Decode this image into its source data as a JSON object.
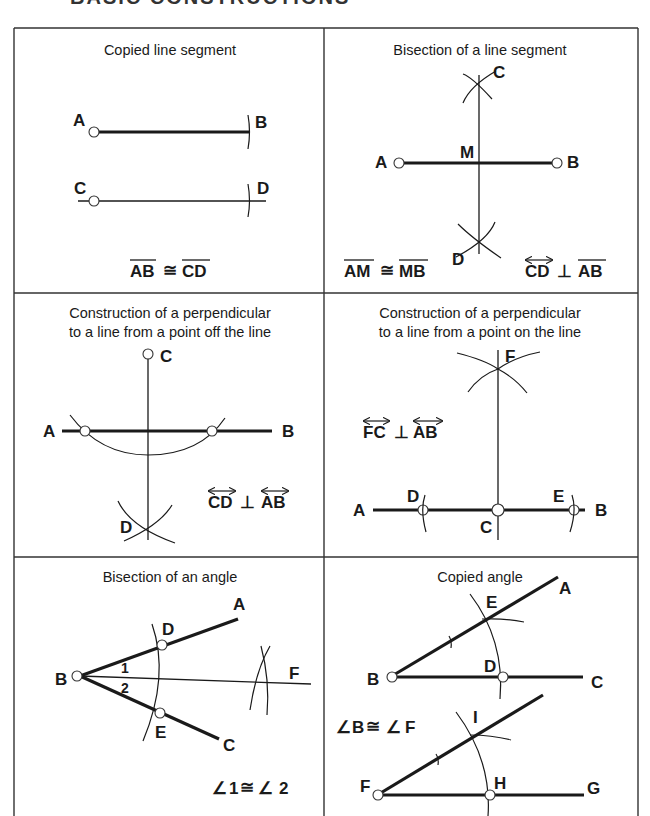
{
  "page": {
    "cropped_heading": "BASIC CONSTRUCTIONS"
  },
  "panels": [
    {
      "title": "Copied line segment",
      "points": {
        "A": "A",
        "B": "B",
        "C": "C",
        "D": "D"
      },
      "relation": {
        "left": "AB",
        "symbol": "≅",
        "right": "CD"
      }
    },
    {
      "title": "Bisection of a line segment",
      "points": {
        "A": "A",
        "B": "B",
        "C": "C",
        "D": "D",
        "M": "M"
      },
      "relation1": {
        "left": "AM",
        "symbol": "≅",
        "right": "MB"
      },
      "relation2": {
        "left": "CD",
        "symbol": "⊥",
        "right": "AB"
      }
    },
    {
      "title_line1": "Construction of a perpendicular",
      "title_line2": "to a line from a point off the line",
      "points": {
        "A": "A",
        "B": "B",
        "C": "C",
        "D": "D"
      },
      "relation": {
        "left": "CD",
        "symbol": "⊥",
        "right": "AB"
      }
    },
    {
      "title_line1": "Construction of a perpendicular",
      "title_line2": "to a line from a point on the line",
      "points": {
        "A": "A",
        "B": "B",
        "C": "C",
        "D": "D",
        "E": "E",
        "F": "F"
      },
      "relation": {
        "left": "FC",
        "symbol": "⊥",
        "right": "AB"
      }
    },
    {
      "title": "Bisection of an angle",
      "points": {
        "A": "A",
        "B": "B",
        "C": "C",
        "D": "D",
        "E": "E",
        "F": "F"
      },
      "angle_labels": {
        "one": "1",
        "two": "2"
      },
      "relation": {
        "angle": "∠",
        "left": "1",
        "symbol": "≅",
        "right": "2"
      }
    },
    {
      "title": "Copied angle",
      "points": {
        "A": "A",
        "B": "B",
        "C": "C",
        "D": "D",
        "E": "E",
        "F": "F",
        "G": "G",
        "H": "H",
        "I": "I"
      },
      "relation": {
        "angle": "∠",
        "left": "B",
        "symbol": "≅",
        "right": "F"
      }
    }
  ]
}
